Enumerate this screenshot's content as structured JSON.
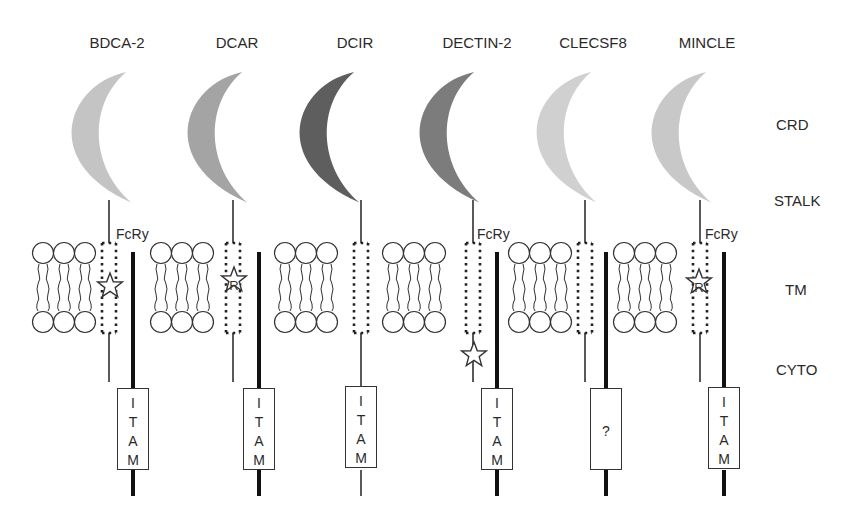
{
  "diagram": {
    "receptors": [
      {
        "name": "BDCA-2",
        "crd_color": "#c4c4c4",
        "fcr_label": "FcRy",
        "star": "tm",
        "star_letter": "",
        "box": [
          "I",
          "T",
          "A",
          "M"
        ]
      },
      {
        "name": "DCAR",
        "crd_color": "#a4a4a4",
        "fcr_label": "",
        "star": "tm",
        "star_letter": "R",
        "box": [
          "I",
          "T",
          "A",
          "M"
        ]
      },
      {
        "name": "DCIR",
        "crd_color": "#5e5e5e",
        "fcr_label": "",
        "star": "none",
        "star_letter": "",
        "box": [
          "I",
          "T",
          "A",
          "M"
        ]
      },
      {
        "name": "DECTIN-2",
        "crd_color": "#7c7c7c",
        "fcr_label": "FcRy",
        "star": "cyto",
        "star_letter": "",
        "box": [
          "I",
          "T",
          "A",
          "M"
        ]
      },
      {
        "name": "CLECSF8",
        "crd_color": "#d0d0d0",
        "fcr_label": "",
        "star": "none",
        "star_letter": "",
        "box": [
          "?"
        ]
      },
      {
        "name": "MINCLE",
        "crd_color": "#c8c8c8",
        "fcr_label": "FcRy",
        "star": "tm",
        "star_letter": "R",
        "box": [
          "I",
          "T",
          "A",
          "M"
        ]
      }
    ],
    "region_labels": {
      "crd": "CRD",
      "stalk": "STALK",
      "tm": "TM",
      "cyto": "CYTO"
    }
  }
}
